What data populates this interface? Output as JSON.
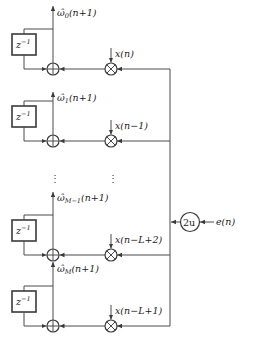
{
  "diagram": {
    "type": "LMS adaptive filter weight update block diagram",
    "delay_label": "z",
    "delay_exp": "−1",
    "gain_label": "2u",
    "error_input": "e(n)",
    "ellipsis": "⋮",
    "rows": [
      {
        "output_sym": "ω̂",
        "output_sub": "0",
        "output_arg": "(n+1)",
        "input": "x(n)"
      },
      {
        "output_sym": "ω̂",
        "output_sub": "1",
        "output_arg": "(n+1)",
        "input": "x(n−1)"
      },
      {
        "output_sym": "ω̂",
        "output_sub": "M−1",
        "output_arg": "(n+1)",
        "input": "x(n−L+2)"
      },
      {
        "output_sym": "ω̂",
        "output_sub": "M",
        "output_arg": "(n+1)",
        "input": "x(n−L+1)"
      }
    ]
  },
  "colors": {
    "line": "#4a4a4a",
    "background": "#ffffff"
  }
}
